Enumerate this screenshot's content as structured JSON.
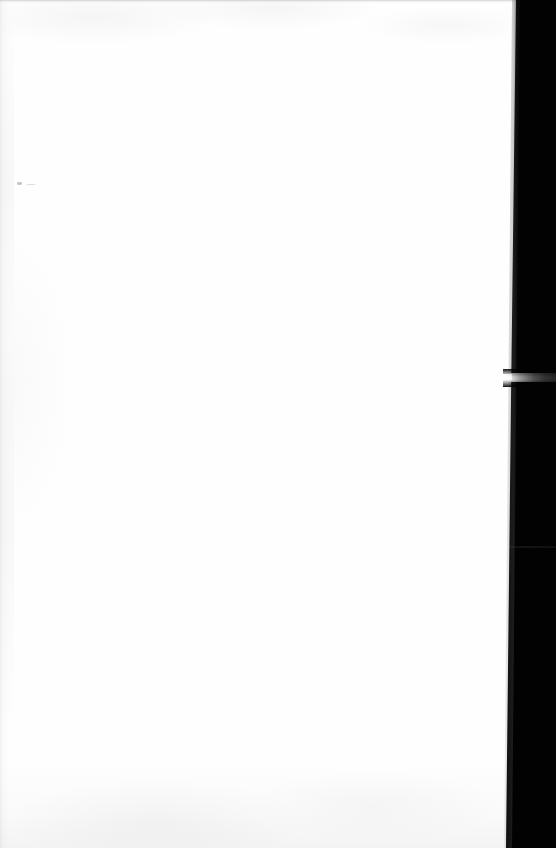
{
  "document": {
    "kind": "scanned-page",
    "title": "Blank scanned page",
    "width": 556,
    "height": 848,
    "orientation": "portrait",
    "text_content": "",
    "notes": "No text, headings, tables, controls or figures are rendered in the image."
  },
  "colors": {
    "page_background": "#fefefe",
    "canvas_background": "#ffffff",
    "void_band": "#020202",
    "edge_line": "#787880",
    "speck": "#78787d",
    "notch_highlight": "#ffffff"
  },
  "regions": [
    {
      "name": "page-surface",
      "role": "White paper area occupying the left and center of the scan.",
      "bounds": {
        "x": 0,
        "y": 0,
        "width": 510,
        "height": 848
      },
      "fill": "#fefefe"
    },
    {
      "name": "dark-band",
      "role": "Solid black scanner void to the right of the page edge; left boundary slants inward toward the bottom.",
      "bounds": {
        "x": 506,
        "y": 0,
        "width": 50,
        "height": 848
      },
      "fill": "#020202",
      "edge_x_top": 516,
      "edge_x_middle": 511,
      "edge_x_bottom": 506
    },
    {
      "name": "notch",
      "role": "Bright horizontal streak cutting fully across the dark band, brightest at its left end and fading to gray at the right edge.",
      "bounds": {
        "x": 503,
        "y": 373,
        "width": 53,
        "height": 9
      }
    },
    {
      "name": "band-seam",
      "role": "Barely perceptible horizontal tone change inside the dark band.",
      "bounds": {
        "x": 506,
        "y": 546,
        "width": 50,
        "height": 2
      }
    }
  ],
  "artifacts": [
    {
      "name": "top-edge-line",
      "role": "Faint gray hairline along the top edge of the scan.",
      "bounds": {
        "x": 0,
        "y": 0,
        "width": 520,
        "height": 3
      }
    },
    {
      "name": "left-edge-streaks",
      "role": "Faint vertical gray streaks along the left margin.",
      "bounds": {
        "x": 0,
        "y": 0,
        "width": 14,
        "height": 848
      }
    },
    {
      "name": "bottom-edge-smudge",
      "role": "Low-contrast gray mottling near the bottom of the page.",
      "bounds": {
        "x": 0,
        "y": 758,
        "width": 520,
        "height": 90
      }
    },
    {
      "name": "speck",
      "role": "Small isolated dust speck on the paper.",
      "bounds": {
        "x": 17,
        "y": 182,
        "width": 5,
        "height": 3
      }
    }
  ]
}
